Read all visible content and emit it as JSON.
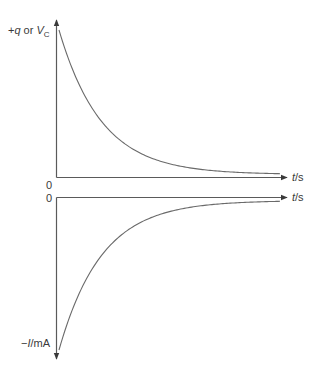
{
  "chart_data": [
    {
      "type": "line",
      "title": "",
      "description": "Capacitor discharge: charge or voltage decays exponentially to zero",
      "ylabel": "+q or V_C",
      "ylabel_parts": {
        "sign": "+",
        "q": "q",
        "or": " or ",
        "V": "V",
        "sub": "C"
      },
      "xlabel": "t/s",
      "xlabel_parts": {
        "t": "t",
        "unit": "/s"
      },
      "origin_label": "0",
      "curve": "exponential decay from maximum toward 0",
      "x": [
        0,
        0.5,
        1,
        1.5,
        2,
        3,
        4,
        5
      ],
      "values": [
        1.0,
        0.61,
        0.37,
        0.22,
        0.14,
        0.05,
        0.02,
        0.0
      ],
      "grid": false,
      "legend": null
    },
    {
      "type": "line",
      "title": "",
      "description": "Discharge current: negative current rises exponentially toward zero",
      "ylabel": "−I/mA",
      "ylabel_parts": {
        "sign": "−",
        "I": "I",
        "unit": "/mA"
      },
      "xlabel": "t/s",
      "xlabel_parts": {
        "t": "t",
        "unit": "/s"
      },
      "origin_label": "0",
      "curve": "exponential approach from maximum negative value toward 0",
      "x": [
        0,
        0.5,
        1,
        1.5,
        2,
        3,
        4,
        5
      ],
      "values": [
        -1.0,
        -0.61,
        -0.37,
        -0.22,
        -0.14,
        -0.05,
        -0.02,
        0.0
      ],
      "grid": false,
      "legend": null
    }
  ],
  "colors": {
    "axis": "#5a5a5a",
    "curve": "#6a6a6a",
    "text": "#3a3a3a"
  }
}
